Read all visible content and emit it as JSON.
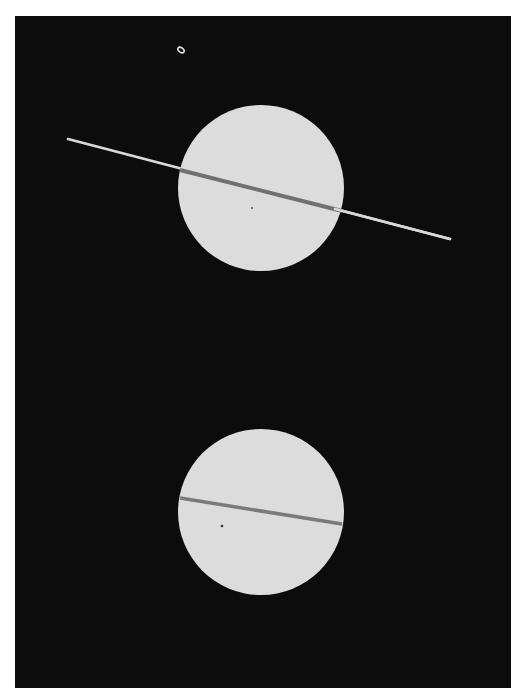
{
  "image": {
    "subject": "Saturn with rings nearly edge-on, two photographic exposures",
    "background_color": "#0c0c0c",
    "page_color": "#ffffff",
    "planet_color": "#dcdcdc",
    "ring_color": "#d8d8d8",
    "ring_shadow_color": "#6e6e6e"
  },
  "objects": [
    {
      "name": "moon",
      "cx": 181,
      "cy": 50,
      "rx": 3,
      "ry": 2
    },
    {
      "name": "saturn-upper",
      "cx": 261,
      "cy": 188,
      "r": 83,
      "ring": {
        "x1": 68,
        "y1": 139,
        "x2": 450,
        "y2": 239
      },
      "shadow": {
        "x1": 180,
        "y1": 170,
        "x2": 342,
        "y2": 211
      }
    },
    {
      "name": "saturn-lower",
      "cx": 261,
      "cy": 512,
      "r": 83,
      "shadow": {
        "x1": 180,
        "y1": 498,
        "x2": 342,
        "y2": 524
      }
    }
  ]
}
